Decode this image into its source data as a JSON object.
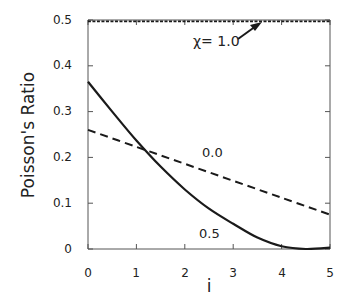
{
  "chart_data": {
    "type": "line",
    "title": "",
    "xlabel": "i",
    "ylabel": "Poisson's Ratio",
    "xlim": [
      0,
      5
    ],
    "ylim": [
      0,
      0.5
    ],
    "x_ticks": [
      "0",
      "1",
      "2",
      "3",
      "4",
      "5"
    ],
    "y_ticks": [
      "0",
      "0.1",
      "0.2",
      "0.3",
      "0.4",
      "0.5"
    ],
    "grid": false,
    "legend": "none (inline labels)",
    "series": [
      {
        "name": "χ=1.0",
        "style": "dotted",
        "x": [
          0,
          1,
          2,
          3,
          4,
          5
        ],
        "values": [
          0.497,
          0.497,
          0.497,
          0.497,
          0.497,
          0.497
        ]
      },
      {
        "name": "0.0",
        "style": "dashed",
        "x": [
          0,
          1,
          2,
          3,
          4,
          5
        ],
        "values": [
          0.26,
          0.223,
          0.186,
          0.149,
          0.112,
          0.075
        ]
      },
      {
        "name": "0.5",
        "style": "solid",
        "x": [
          0,
          0.5,
          1,
          1.5,
          2,
          2.5,
          3,
          3.5,
          4,
          4.5,
          5
        ],
        "values": [
          0.365,
          0.3,
          0.237,
          0.18,
          0.13,
          0.088,
          0.055,
          0.025,
          0.006,
          0.0,
          0.003
        ]
      }
    ],
    "annotations": [
      {
        "text": "χ= 1.0",
        "target_series": "χ=1.0",
        "arrow": true
      },
      {
        "text": "0.0",
        "target_series": "0.0"
      },
      {
        "text": "0.5",
        "target_series": "0.5"
      }
    ]
  },
  "labels": {
    "ylabel": "Poisson's Ratio",
    "xlabel": "i",
    "annot_chi": "χ= 1.0",
    "annot_00": "0.0",
    "annot_05": "0.5",
    "x_ticks": [
      "0",
      "1",
      "2",
      "3",
      "4",
      "5"
    ],
    "y_ticks": [
      "0",
      "0.1",
      "0.2",
      "0.3",
      "0.4",
      "0.5"
    ]
  },
  "colors": {
    "line": "#1a1a1a",
    "axis": "#555555"
  }
}
